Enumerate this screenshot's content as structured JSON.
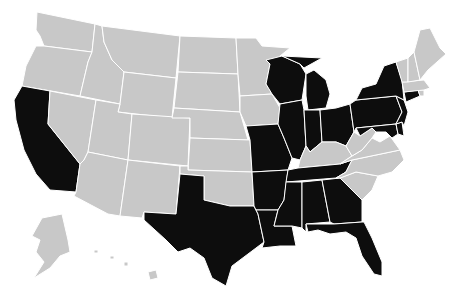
{
  "map": {
    "type": "choropleth",
    "region": "United States",
    "colors": {
      "highlighted": "#0d0d0d",
      "default": "#c8c8c8",
      "border": "#ffffff",
      "background": "#ffffff"
    },
    "highlighted_states": [
      "CA",
      "TX",
      "MO",
      "AR",
      "LA",
      "MS",
      "AL",
      "GA",
      "FL",
      "TN",
      "IL",
      "IN",
      "OH",
      "MI",
      "WI",
      "PA",
      "NY",
      "NJ",
      "CT",
      "MD",
      "DE"
    ],
    "default_states": [
      "WA",
      "OR",
      "ID",
      "MT",
      "WY",
      "NV",
      "UT",
      "AZ",
      "CO",
      "NM",
      "ND",
      "SD",
      "NE",
      "KS",
      "OK",
      "MN",
      "IA",
      "KY",
      "WV",
      "VA",
      "NC",
      "SC",
      "ME",
      "NH",
      "VT",
      "MA",
      "RI",
      "AK",
      "HI"
    ],
    "states": [
      {
        "id": "WA",
        "name": "Washington",
        "d": "M37,12 L95,24 L92,52 L44,46 L40,36 L36,30 Z"
      },
      {
        "id": "OR",
        "name": "Oregon",
        "d": "M44,46 L92,52 L88,62 L80,96 L22,86 L26,66 L36,46 Z"
      },
      {
        "id": "CA",
        "name": "California",
        "d": "M22,86 L50,91 L48,124 L80,164 L76,192 L50,190 L36,174 L24,150 L16,120 L14,100 Z"
      },
      {
        "id": "NV",
        "name": "Nevada",
        "d": "M50,91 L96,100 L88,152 L84,160 L80,164 L48,124 Z"
      },
      {
        "id": "ID",
        "name": "Idaho",
        "d": "M95,24 L102,26 L104,42 L112,60 L124,72 L120,104 L80,96 L88,62 L92,52 Z"
      },
      {
        "id": "MT",
        "name": "Montana",
        "d": "M102,26 L180,36 L176,78 L124,72 L112,60 L104,42 Z"
      },
      {
        "id": "WY",
        "name": "Wyoming",
        "d": "M124,72 L176,78 L172,118 L118,112 L120,104 Z"
      },
      {
        "id": "UT",
        "name": "Utah",
        "d": "M96,100 L120,104 L118,112 L132,114 L128,160 L88,152 Z"
      },
      {
        "id": "AZ",
        "name": "Arizona",
        "d": "M88,152 L128,160 L120,216 L108,214 L74,196 L76,192 L80,164 L84,160 Z"
      },
      {
        "id": "CO",
        "name": "Colorado",
        "d": "M132,114 L190,118 L188,166 L128,160 Z"
      },
      {
        "id": "NM",
        "name": "New Mexico",
        "d": "M128,160 L180,166 L176,214 L144,212 L142,218 L120,216 Z"
      },
      {
        "id": "ND",
        "name": "North Dakota",
        "d": "M180,36 L236,38 L238,74 L178,72 Z"
      },
      {
        "id": "SD",
        "name": "South Dakota",
        "d": "M178,72 L238,74 L240,112 L174,108 Z"
      },
      {
        "id": "NE",
        "name": "Nebraska",
        "d": "M174,108 L240,112 L248,140 L190,138 L190,118 L172,118 Z"
      },
      {
        "id": "KS",
        "name": "Kansas",
        "d": "M190,138 L250,140 L252,172 L188,170 Z"
      },
      {
        "id": "OK",
        "name": "Oklahoma",
        "d": "M180,166 L188,166 L188,170 L252,172 L254,206 L230,206 L204,200 L204,176 L180,174 Z"
      },
      {
        "id": "TX",
        "name": "Texas",
        "d": "M180,174 L204,176 L204,200 L230,206 L254,206 L258,214 L264,242 L248,254 L232,266 L226,286 L212,278 L204,258 L190,248 L178,252 L166,240 L144,220 L144,212 L176,214 Z"
      },
      {
        "id": "MN",
        "name": "Minnesota",
        "d": "M236,38 L256,38 L262,46 L290,48 L270,64 L266,84 L272,94 L240,96 L238,74 Z"
      },
      {
        "id": "IA",
        "name": "Iowa",
        "d": "M240,96 L272,94 L280,108 L278,124 L246,126 L240,112 Z"
      },
      {
        "id": "MO",
        "name": "Missouri",
        "d": "M246,126 L278,124 L284,138 L292,158 L288,170 L252,172 L250,140 Z"
      },
      {
        "id": "AR",
        "name": "Arkansas",
        "d": "M252,172 L288,170 L284,200 L278,210 L256,210 L254,206 Z"
      },
      {
        "id": "LA",
        "name": "Louisiana",
        "d": "M256,210 L278,210 L274,226 L292,226 L296,246 L280,246 L262,248 L264,242 L258,214 Z"
      },
      {
        "id": "WI",
        "name": "Wisconsin",
        "d": "M266,60 L282,56 L300,64 L306,74 L302,100 L280,104 L272,94 L266,84 L270,64 Z"
      },
      {
        "id": "IL",
        "name": "Illinois",
        "d": "M280,104 L302,100 L304,110 L306,146 L300,160 L292,158 L284,138 L278,124 Z"
      },
      {
        "id": "MI",
        "name": "Michigan",
        "d": "M282,56 L322,58 L304,68 L300,64 Z M306,74 L314,70 L326,80 L330,94 L326,108 L308,110 L306,96 Z"
      },
      {
        "id": "IN",
        "name": "Indiana",
        "d": "M304,110 L320,110 L322,142 L310,152 L306,146 Z"
      },
      {
        "id": "OH",
        "name": "Ohio",
        "d": "M320,110 L336,108 L350,104 L354,132 L346,146 L336,142 L322,142 Z"
      },
      {
        "id": "KY",
        "name": "Kentucky",
        "d": "M300,160 L306,146 L310,152 L322,142 L336,142 L346,146 L352,156 L340,164 L298,168 Z"
      },
      {
        "id": "TN",
        "name": "Tennessee",
        "d": "M288,170 L298,168 L340,164 L352,160 L346,172 L336,178 L286,182 Z"
      },
      {
        "id": "MS",
        "name": "Mississippi",
        "d": "M286,182 L302,182 L302,228 L292,226 L274,226 L278,210 L284,200 Z"
      },
      {
        "id": "AL",
        "name": "Alabama",
        "d": "M302,182 L322,180 L330,222 L306,224 L306,232 L302,228 Z"
      },
      {
        "id": "GA",
        "name": "Georgia",
        "d": "M322,180 L340,178 L362,200 L362,222 L334,224 L330,222 Z"
      },
      {
        "id": "FL",
        "name": "Florida",
        "d": "M306,224 L334,224 L362,222 L364,222 L372,238 L382,262 L382,276 L374,274 L362,256 L356,238 L346,232 L330,234 L318,230 L308,232 Z"
      },
      {
        "id": "SC",
        "name": "South Carolina",
        "d": "M340,178 L356,172 L378,176 L372,190 L362,200 Z"
      },
      {
        "id": "NC",
        "name": "North Carolina",
        "d": "M336,178 L346,172 L352,160 L400,150 L404,160 L392,172 L378,176 L356,172 L340,178 Z"
      },
      {
        "id": "VA",
        "name": "Virginia",
        "d": "M340,164 L352,156 L362,150 L372,138 L380,142 L390,136 L400,150 L352,160 Z"
      },
      {
        "id": "WV",
        "name": "West Virginia",
        "d": "M346,146 L354,132 L360,136 L372,128 L376,132 L372,138 L362,150 L352,156 Z"
      },
      {
        "id": "PA",
        "name": "Pennsylvania",
        "d": "M350,104 L356,100 L396,96 L402,112 L396,124 L356,128 L354,132 Z"
      },
      {
        "id": "MD",
        "name": "Maryland",
        "d": "M356,128 L396,124 L398,134 L392,138 L386,132 L376,132 L372,128 L360,136 Z"
      },
      {
        "id": "DE",
        "name": "Delaware",
        "d": "M396,124 L402,122 L404,136 L398,134 Z"
      },
      {
        "id": "NJ",
        "name": "New Jersey",
        "d": "M396,96 L404,100 L408,112 L404,126 L402,122 L396,124 L402,112 Z"
      },
      {
        "id": "NY",
        "name": "New York",
        "d": "M356,100 L362,88 L376,84 L384,66 L396,62 L402,80 L404,100 L396,96 Z"
      },
      {
        "id": "CT",
        "name": "Connecticut",
        "d": "M404,92 L418,90 L420,96 L406,102 Z"
      },
      {
        "id": "RI",
        "name": "Rhode Island",
        "d": "M418,90 L424,90 L424,96 L420,96 Z"
      },
      {
        "id": "MA",
        "name": "Massachusetts",
        "d": "M402,82 L424,80 L430,88 L424,90 L404,92 Z"
      },
      {
        "id": "VT",
        "name": "Vermont",
        "d": "M396,62 L408,58 L408,82 L402,82 Z"
      },
      {
        "id": "NH",
        "name": "New Hampshire",
        "d": "M408,58 L414,52 L420,80 L408,82 Z"
      },
      {
        "id": "ME",
        "name": "Maine",
        "d": "M414,52 L420,30 L430,28 L440,48 L446,54 L428,70 L420,80 Z"
      },
      {
        "id": "AK",
        "name": "Alaska",
        "d": "M42,218 L62,214 L68,240 L70,252 L60,256 L50,268 L34,278 L44,262 L36,252 L40,240 L32,236 Z"
      },
      {
        "id": "HI",
        "name": "Hawaii",
        "d": "M148,272 L156,270 L158,278 L150,280 Z M124,262 L128,262 L128,266 L124,266 Z M110,256 L114,256 L114,259 L110,259 Z M94,250 L98,250 L98,253 L94,253 Z"
      }
    ]
  }
}
